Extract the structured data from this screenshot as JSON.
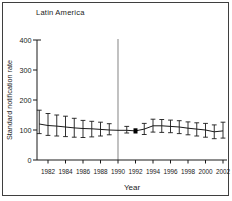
{
  "figure": {
    "title": "Latin America",
    "xlabel": "Year",
    "ylabel": "Standard notification rate"
  },
  "colors": {
    "line": "#1a1a1a",
    "axis": "#1a1a1a",
    "reference_line": "#8f8f8f",
    "frame_border": "#3f3f3f",
    "marker_fill": "#000000"
  },
  "chart_data": {
    "type": "line",
    "title": "Latin America",
    "xlabel": "Year",
    "ylabel": "Standard notification rate",
    "xlim": [
      1980.5,
      2003
    ],
    "ylim": [
      0,
      400
    ],
    "yticks": [
      0,
      100,
      200,
      300,
      400
    ],
    "xticks": [
      1982,
      1984,
      1986,
      1988,
      1990,
      1992,
      1994,
      1996,
      1998,
      2000,
      2002
    ],
    "grid": false,
    "legend": false,
    "reference_line": {
      "orientation": "vertical",
      "x": 1990
    },
    "series": [
      {
        "name": "standard-notification-rate",
        "error_bars": true,
        "points": [
          {
            "year": 1981,
            "value": 120,
            "lo": 88,
            "hi": 166
          },
          {
            "year": 1982,
            "value": 115,
            "lo": 82,
            "hi": 155
          },
          {
            "year": 1983,
            "value": 113,
            "lo": 80,
            "hi": 150
          },
          {
            "year": 1984,
            "value": 110,
            "lo": 78,
            "hi": 146
          },
          {
            "year": 1985,
            "value": 107,
            "lo": 76,
            "hi": 139
          },
          {
            "year": 1986,
            "value": 105,
            "lo": 75,
            "hi": 132
          },
          {
            "year": 1987,
            "value": 104,
            "lo": 77,
            "hi": 129
          },
          {
            "year": 1988,
            "value": 102,
            "lo": 80,
            "hi": 126
          },
          {
            "year": 1989,
            "value": 100,
            "lo": 84,
            "hi": 121
          },
          {
            "year": 1990,
            "value": 99
          },
          {
            "year": 1991,
            "value": 99,
            "lo": 90,
            "hi": 112
          },
          {
            "year": 1992,
            "value": 97,
            "marker": "filled-square"
          },
          {
            "year": 1993,
            "value": 103,
            "lo": 85,
            "hi": 122
          },
          {
            "year": 1994,
            "value": 114,
            "lo": 93,
            "hi": 136
          },
          {
            "year": 1995,
            "value": 114,
            "lo": 92,
            "hi": 135
          },
          {
            "year": 1996,
            "value": 112,
            "lo": 91,
            "hi": 133
          },
          {
            "year": 1997,
            "value": 110,
            "lo": 88,
            "hi": 131
          },
          {
            "year": 1998,
            "value": 106,
            "lo": 84,
            "hi": 127
          },
          {
            "year": 1999,
            "value": 103,
            "lo": 80,
            "hi": 124
          },
          {
            "year": 2000,
            "value": 100,
            "lo": 76,
            "hi": 122
          },
          {
            "year": 2001,
            "value": 94,
            "lo": 71,
            "hi": 117
          },
          {
            "year": 2002,
            "value": 97,
            "lo": 73,
            "hi": 126
          }
        ]
      }
    ]
  }
}
